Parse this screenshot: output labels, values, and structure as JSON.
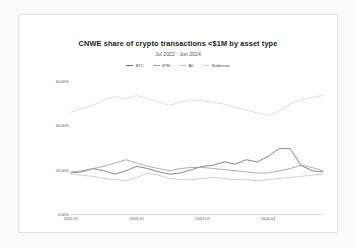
{
  "chart_data": {
    "type": "line",
    "title": "CNWE share of crypto transactions <$1M by asset type",
    "subtitle": "Jul 2022 - Jun 2024",
    "xlabel": "",
    "ylabel": "",
    "ylim": [
      0,
      60
    ],
    "grid": false,
    "legend_position": "top-center",
    "ytick_labels": [
      "60.00%",
      "40.00%",
      "20.00%",
      "0.00%"
    ],
    "ytick_values": [
      60,
      40,
      20,
      0
    ],
    "xtick_labels": [
      "2022-07",
      "2023-01",
      "2023-07",
      "2024-01"
    ],
    "xtick_positions": [
      0,
      6,
      12,
      18
    ],
    "x": [
      "2022-07",
      "2022-08",
      "2022-09",
      "2022-10",
      "2022-11",
      "2022-12",
      "2023-01",
      "2023-02",
      "2023-03",
      "2023-04",
      "2023-05",
      "2023-06",
      "2023-07",
      "2023-08",
      "2023-09",
      "2023-10",
      "2023-11",
      "2023-12",
      "2024-01",
      "2024-02",
      "2024-03",
      "2024-04",
      "2024-05",
      "2024-06"
    ],
    "series": [
      {
        "name": "BTC",
        "color": "#6b6b6b",
        "values": [
          18.5,
          19.0,
          20.5,
          19.5,
          18.0,
          19.5,
          21.5,
          20.5,
          19.0,
          18.0,
          18.5,
          20.0,
          21.5,
          22.0,
          23.5,
          22.5,
          24.5,
          23.5,
          26.0,
          29.5,
          29.5,
          22.0,
          19.5,
          19.0
        ]
      },
      {
        "name": "ETH",
        "color": "#9a9a9a",
        "values": [
          19.0,
          19.5,
          20.5,
          21.5,
          23.0,
          24.5,
          23.0,
          21.5,
          20.5,
          19.5,
          20.5,
          21.0,
          21.0,
          20.5,
          20.0,
          19.5,
          19.0,
          18.5,
          18.5,
          19.5,
          20.5,
          22.0,
          21.0,
          19.5
        ]
      },
      {
        "name": "Alt",
        "color": "#c4c4c4",
        "values": [
          18.0,
          17.5,
          17.0,
          16.0,
          15.5,
          15.0,
          16.5,
          18.5,
          17.5,
          16.0,
          15.5,
          15.5,
          16.0,
          16.5,
          16.0,
          15.5,
          15.5,
          15.0,
          15.5,
          16.0,
          16.5,
          17.0,
          17.5,
          18.0
        ]
      },
      {
        "name": "Stablecoin",
        "color": "#d4d4d4",
        "values": [
          46.0,
          47.5,
          49.0,
          51.5,
          53.0,
          52.0,
          53.5,
          52.0,
          50.5,
          49.0,
          50.5,
          51.5,
          51.0,
          50.5,
          49.5,
          48.0,
          47.0,
          45.5,
          44.5,
          46.5,
          49.5,
          51.5,
          52.5,
          53.5
        ]
      }
    ]
  }
}
